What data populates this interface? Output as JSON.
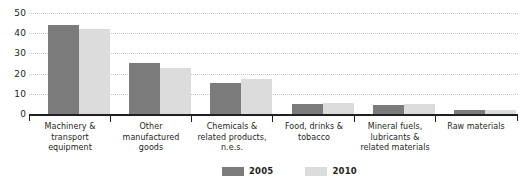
{
  "chart_data": {
    "type": "bar",
    "title": "",
    "subtitle": "",
    "xlabel": "",
    "ylabel": "",
    "ylim": [
      0,
      50
    ],
    "yticks": [
      0,
      10,
      20,
      30,
      40,
      50
    ],
    "ytick_labels": [
      "0",
      "10",
      "20",
      "30",
      "40",
      "50"
    ],
    "grid": true,
    "legend_position": "bottom-center",
    "categories": [
      "Machinery & transport equipment",
      "Other manufactured goods",
      "Chemicals & related products, n.e.s.",
      "Food, drinks & tobacco",
      "Mineral fuels, lubricants & related materials",
      "Raw materials"
    ],
    "category_lines": [
      [
        "Machinery &",
        "transport",
        "equipment"
      ],
      [
        "Other",
        "manufactured",
        "goods"
      ],
      [
        "Chemicals &",
        "related products,",
        "n.e.s."
      ],
      [
        "Food, drinks &",
        "tobacco"
      ],
      [
        "Mineral fuels,",
        "lubricants &",
        "related materials"
      ],
      [
        "Raw materials"
      ]
    ],
    "series": [
      {
        "name": "2005",
        "color": "#7b7b7b",
        "values": [
          44,
          25.5,
          15.5,
          5,
          4.5,
          2
        ]
      },
      {
        "name": "2010",
        "color": "#dcdcdc",
        "values": [
          42,
          23,
          17.5,
          5.5,
          5,
          2
        ]
      }
    ]
  },
  "legend": {
    "items": [
      {
        "label": "2005",
        "color": "#7b7b7b"
      },
      {
        "label": "2010",
        "color": "#dcdcdc"
      }
    ]
  },
  "colors": {
    "series_2005": "#7b7b7b",
    "series_2010": "#dcdcdc",
    "axis": "#231f20",
    "gridline": "#c9c9c9",
    "background": "#ffffff"
  }
}
